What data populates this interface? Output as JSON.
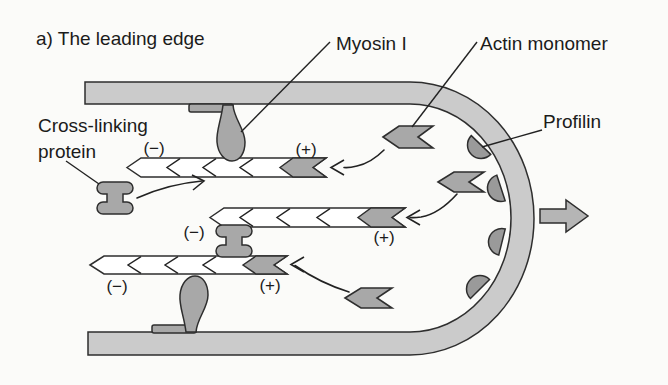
{
  "figure": {
    "title": "a) The leading edge",
    "labels": {
      "myosin": "Myosin I",
      "actin_monomer": "Actin monomer",
      "profilin": "Profilin",
      "cross_linking_line1": "Cross-linking",
      "cross_linking_line2": "protein"
    },
    "filaments": [
      {
        "id": 1,
        "minus": "(−)",
        "plus": "(+)"
      },
      {
        "id": 2,
        "minus": "(−)",
        "plus": "(+)"
      },
      {
        "id": 3,
        "minus": "(−)",
        "plus": "(+)"
      }
    ],
    "colors": {
      "background": "#fbfbf9",
      "membrane_fill": "#cbcbcb",
      "protein_fill": "#a8a8a8",
      "profilin_fill": "#9a9a9a",
      "direction_arrow_fill": "#b5b5b5",
      "filament_fill": "#ffffff",
      "outline": "#2e2e2e"
    }
  }
}
